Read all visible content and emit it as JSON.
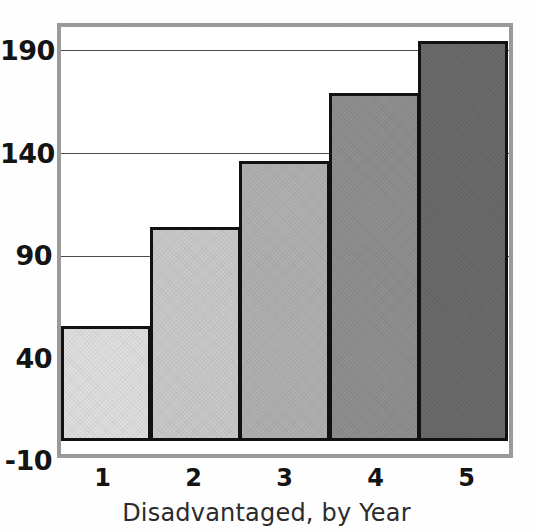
{
  "figure": {
    "caption": "Disadvantaged, by Year",
    "clipped_title_fragment": "",
    "frame_color": "#9a9a9a",
    "bar_outline_color": "#111111",
    "gridline_color": "#4a4a4a",
    "background_color": "#ffffff",
    "text_color": "#141414"
  },
  "chart_data": {
    "type": "bar",
    "title": "",
    "xlabel": "Disadvantaged, by Year",
    "ylabel": "",
    "categories": [
      "1",
      "2",
      "3",
      "4",
      "5"
    ],
    "values": [
      56,
      104,
      136,
      169,
      194
    ],
    "ylim": [
      -10,
      200
    ],
    "ytick_labels": [
      "190",
      "140",
      "90",
      "40",
      "-10"
    ],
    "ytick_values": [
      190,
      140,
      90,
      40,
      -10
    ],
    "xtick_labels": [
      "1",
      "2",
      "3",
      "4",
      "5"
    ],
    "grid": true,
    "gridlines_at": [
      190,
      140,
      90
    ],
    "legend": null,
    "legend_position": "none",
    "bar_gap": 0,
    "series": [
      {
        "name": "Disadvantaged",
        "values": [
          56,
          104,
          136,
          169,
          194
        ],
        "colors": [
          "#dedede",
          "#c9c9c9",
          "#b0b0b0",
          "#8f8f8f",
          "#6a6a6a"
        ]
      }
    ],
    "bars": [
      {
        "category": "1",
        "value": 56,
        "fill": "#dedede"
      },
      {
        "category": "2",
        "value": 104,
        "fill": "#c9c9c9"
      },
      {
        "category": "3",
        "value": 136,
        "fill": "#b0b0b0"
      },
      {
        "category": "4",
        "value": 169,
        "fill": "#8f8f8f"
      },
      {
        "category": "5",
        "value": 194,
        "fill": "#6a6a6a"
      }
    ]
  }
}
